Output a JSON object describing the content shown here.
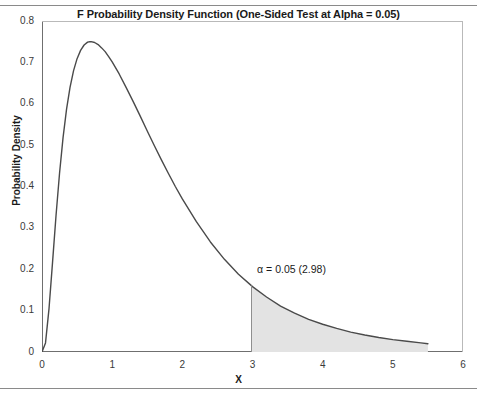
{
  "chart_data": {
    "type": "line",
    "title": "F Probability Density Function (One-Sided Test at Alpha = 0.05)",
    "xlabel": "X",
    "ylabel": "Probability Density",
    "xlim": [
      0,
      6
    ],
    "ylim": [
      0,
      0.8
    ],
    "grid": false,
    "legend": null,
    "x_ticks": [
      0,
      1,
      2,
      3,
      4,
      5,
      6
    ],
    "x_tick_labels": [
      "0",
      "1",
      "2",
      "3",
      "4",
      "5",
      "6"
    ],
    "x_minor_step": 0.5,
    "y_ticks": [
      0,
      0.1,
      0.2,
      0.3,
      0.4,
      0.5,
      0.6,
      0.7,
      0.8
    ],
    "y_tick_labels": [
      "0",
      "0.1",
      "0.2",
      "0.3",
      "0.4",
      "0.5",
      "0.6",
      "0.7",
      "0.8"
    ],
    "y_minor_step": 0.05,
    "curve_color": "#4a4a4a",
    "shade_color": "#e3e3e3",
    "shade_edge_color": "#8f8f8f",
    "annotation": {
      "text": "α = 0.05 (2.98)",
      "alpha": 0.05,
      "critical_value": 2.98,
      "x": 2.98
    },
    "series": [
      {
        "name": "F density",
        "x": [
          0.0,
          0.05,
          0.1,
          0.15,
          0.2,
          0.25,
          0.3,
          0.35,
          0.4,
          0.45,
          0.5,
          0.55,
          0.6,
          0.65,
          0.68,
          0.7,
          0.75,
          0.8,
          0.85,
          0.9,
          0.95,
          1.0,
          1.1,
          1.2,
          1.3,
          1.4,
          1.5,
          1.6,
          1.7,
          1.8,
          1.9,
          2.0,
          2.2,
          2.4,
          2.6,
          2.8,
          2.98,
          3.0,
          3.2,
          3.4,
          3.6,
          3.8,
          4.0,
          4.2,
          4.4,
          4.6,
          4.8,
          5.0,
          5.2,
          5.4,
          5.5
        ],
        "y": [
          0.0,
          0.022,
          0.105,
          0.216,
          0.33,
          0.432,
          0.518,
          0.587,
          0.64,
          0.68,
          0.709,
          0.729,
          0.742,
          0.749,
          0.75,
          0.75,
          0.748,
          0.743,
          0.735,
          0.726,
          0.714,
          0.701,
          0.672,
          0.639,
          0.605,
          0.57,
          0.534,
          0.499,
          0.465,
          0.432,
          0.4,
          0.37,
          0.315,
          0.266,
          0.224,
          0.188,
          0.161,
          0.158,
          0.133,
          0.111,
          0.094,
          0.079,
          0.067,
          0.057,
          0.048,
          0.041,
          0.035,
          0.03,
          0.026,
          0.022,
          0.02
        ]
      }
    ],
    "shaded_region": {
      "from_x": 2.98,
      "to_x": 5.5,
      "label": "rejection region"
    }
  }
}
